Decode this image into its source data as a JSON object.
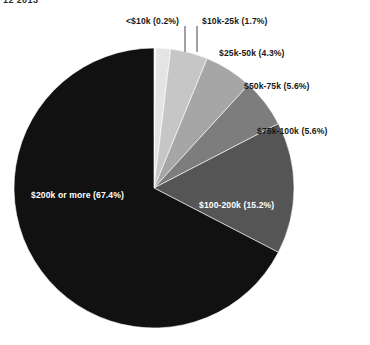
{
  "header": {
    "fragment": "12  2013"
  },
  "chart_data": {
    "type": "pie",
    "title": "",
    "subtitle": "",
    "xlabel": "",
    "ylabel": "",
    "legend_position": "none",
    "grid": false,
    "start_angle_deg": 0,
    "direction": "clockwise",
    "center": {
      "x": 154,
      "y": 188
    },
    "radius": 140,
    "categories": [
      "<$10k",
      "$10k-25k",
      "$25k-50k",
      "$50k-75k",
      "$75k-100k",
      "$100-200k",
      "$200k or more"
    ],
    "values": [
      0.2,
      1.7,
      4.3,
      5.6,
      5.6,
      15.2,
      67.4
    ],
    "colors": [
      "#f2f2f2",
      "#e4e4e4",
      "#c6c6c6",
      "#a6a6a6",
      "#7d7d7d",
      "#555555",
      "#111111"
    ],
    "slices": [
      {
        "label": "<$10k (0.2%)",
        "category": "<$10k",
        "value": 0.2,
        "color": "#f2f2f2",
        "label_placement": "outside-leader",
        "text_color": "#1a1a1a"
      },
      {
        "label": "$10k-25k (1.7%)",
        "category": "$10k-25k",
        "value": 1.7,
        "color": "#e4e4e4",
        "label_placement": "outside-leader",
        "text_color": "#1a1a1a"
      },
      {
        "label": "$25k-50k (4.3%)",
        "category": "$25k-50k",
        "value": 4.3,
        "color": "#c6c6c6",
        "label_placement": "outside",
        "text_color": "#1a1a1a"
      },
      {
        "label": "$50k-75k (5.6%)",
        "category": "$50k-75k",
        "value": 5.6,
        "color": "#a6a6a6",
        "label_placement": "outside",
        "text_color": "#1a1a1a"
      },
      {
        "label": "$75k-100k (5.6%)",
        "category": "$75k-100k",
        "value": 5.6,
        "color": "#7d7d7d",
        "label_placement": "outside",
        "text_color": "#1a1a1a"
      },
      {
        "label": "$100-200k (15.2%)",
        "category": "$100-200k",
        "value": 15.2,
        "color": "#555555",
        "label_placement": "inside",
        "text_color": "#ffffff"
      },
      {
        "label": "$200k or more (67.4%)",
        "category": "$200k or more",
        "value": 67.4,
        "color": "#111111",
        "label_placement": "inside",
        "text_color": "#ffffff"
      }
    ],
    "leader_lines": [
      {
        "for": "<$10k",
        "x": 185,
        "y1": 26,
        "y2": 52
      },
      {
        "for": "$10k-25k",
        "x": 197,
        "y1": 26,
        "y2": 52
      }
    ]
  }
}
